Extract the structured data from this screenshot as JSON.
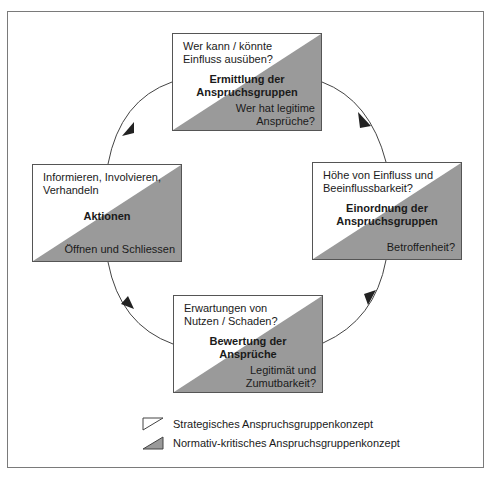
{
  "diagram": {
    "colors": {
      "fill_gray": "#9a9a9a",
      "border": "#555555",
      "frame": "#7a7a7a"
    },
    "boxes": [
      {
        "id": "top",
        "question_top": [
          "Wer kann / könnte",
          "Einfluss ausüben?"
        ],
        "title": [
          "Ermittlung der",
          "Anspruchsgruppen"
        ],
        "question_bottom": [
          "Wer hat legitime",
          "Ansprüche?"
        ]
      },
      {
        "id": "right",
        "question_top": [
          "Höhe von Einfluss und",
          "Beeinflussbarkeit?"
        ],
        "title": [
          "Einordnung der",
          "Anspruchsgruppen"
        ],
        "question_bottom": [
          "Betroffenheit?"
        ]
      },
      {
        "id": "bottom",
        "question_top": [
          "Erwartungen von",
          "Nutzen / Schaden?"
        ],
        "title": [
          "Bewertung der",
          "Ansprüche"
        ],
        "question_bottom": [
          "Legitimät und",
          "Zumutbarkeit?"
        ]
      },
      {
        "id": "left",
        "question_top": [
          "Informieren, Involvieren,",
          "Verhandeln"
        ],
        "title": [
          "Aktionen"
        ],
        "question_bottom": [
          "Öffnen und Schliessen"
        ]
      }
    ],
    "cycle_direction": "clockwise",
    "legend": [
      {
        "icon": "white-triangle-icon",
        "label": "Strategisches Anspruchsgruppenkonzept"
      },
      {
        "icon": "gray-triangle-icon",
        "label": "Normativ-kritisches Anspruchsgruppenkonzept"
      }
    ]
  }
}
